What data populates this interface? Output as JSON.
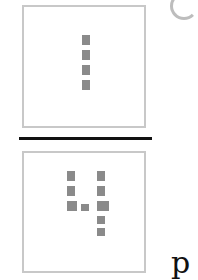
{
  "figure": {
    "numerator": {
      "digit": "1",
      "description": "dotted-matrix digit one"
    },
    "denominator": {
      "digit": "4",
      "description": "dotted-matrix digit four"
    },
    "fraction_bar": true,
    "dot_color": "#8a8a8a",
    "box_border_color": "#c8c8c8"
  },
  "cut_off_text": "p"
}
